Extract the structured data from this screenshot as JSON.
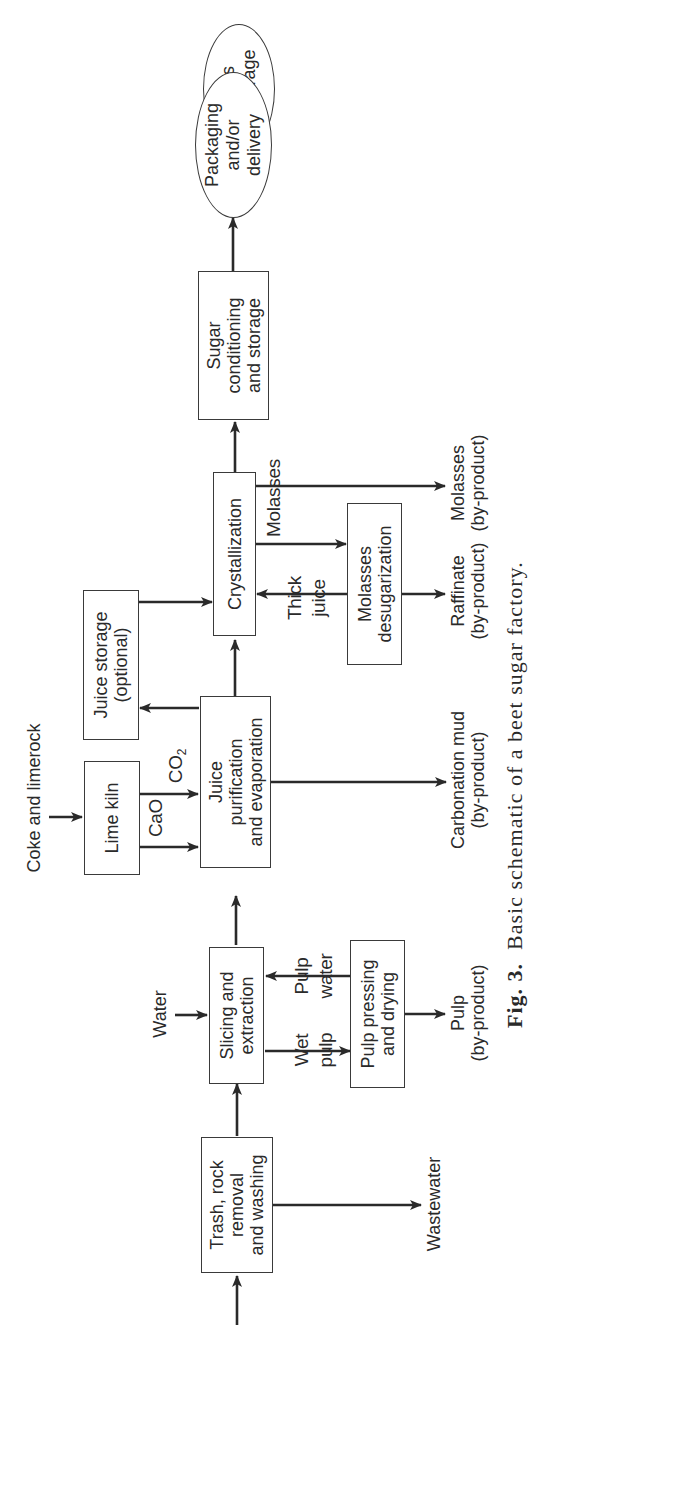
{
  "figure": {
    "number_label": "Fig. 3.",
    "caption": "Basic schematic of a beet sugar factory."
  },
  "nodes": {
    "beets": "Beets\nin storage",
    "trash": "Trash, rock\nremoval\nand washing",
    "slicing": "Slicing and\nextraction",
    "pulp_pressing": "Pulp pressing\nand drying",
    "lime_kiln": "Lime kiln",
    "juice_purification": "Juice\npurification\nand evaporation",
    "juice_storage": "Juice storage\n(optional)",
    "crystallization": "Crystallization",
    "molasses_desugarization": "Molasses\ndesugarization",
    "sugar_conditioning": "Sugar\nconditioning\nand storage",
    "packaging": "Packaging\nand/or\ndelivery"
  },
  "inputs": {
    "water": "Water",
    "coke_limerock": "Coke and limerock"
  },
  "flows": {
    "wet_pulp": "Wet\npulp",
    "pulp_water": "Pulp\nwater",
    "co2_base": "CO",
    "co2_sub": "2",
    "cao": "CaO",
    "molasses": "Molasses",
    "thick_juice": "Thick\njuice"
  },
  "outputs": {
    "wastewater": "Wastewater",
    "pulp": "Pulp\n(by-product)",
    "carbonation_mud": "Carbonation mud\n(by-product)",
    "raffinate": "Raffinate\n(by-product)",
    "molasses": "Molasses\n(by-product)"
  },
  "colors": {
    "line": "#2a2a2a",
    "background": "#ffffff"
  }
}
